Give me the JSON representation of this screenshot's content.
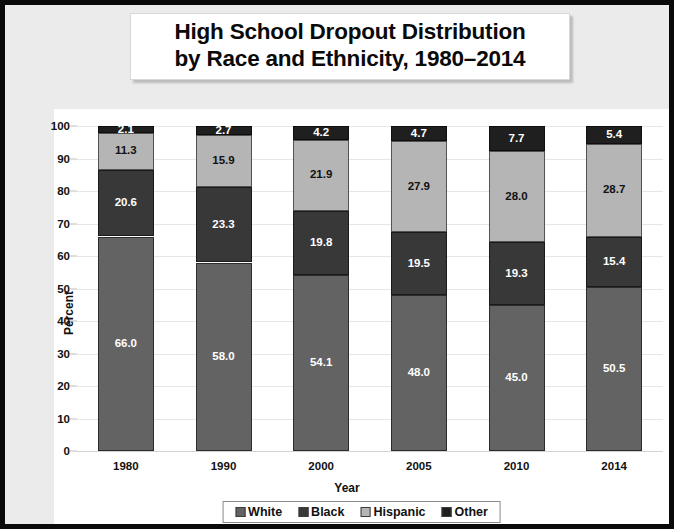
{
  "title": {
    "line1": "High School Dropout Distribution",
    "line2": "by Race and Ethnicity, 1980–2014"
  },
  "colors": {
    "white_series": "#636363",
    "black_series": "#383838",
    "hispanic_series": "#b5b5b5",
    "other_series": "#1f1f1f",
    "frame_border": "#0a0a0a",
    "page_background": "#ebebeb",
    "plot_background": "#ffffff",
    "gridline": "#e6e6e6"
  },
  "legend": {
    "position": "bottom",
    "items": [
      {
        "label": "White",
        "color": "#636363"
      },
      {
        "label": "Black",
        "color": "#383838"
      },
      {
        "label": "Hispanic",
        "color": "#b5b5b5"
      },
      {
        "label": "Other",
        "color": "#1f1f1f"
      }
    ]
  },
  "chart_data": {
    "type": "bar",
    "stacked": true,
    "stack_order_bottom_to_top": [
      "White",
      "Black",
      "Hispanic",
      "Other"
    ],
    "title": "High School Dropout Distribution by Race and Ethnicity, 1980–2014",
    "xlabel": "Year",
    "ylabel": "Percent",
    "ylim": [
      0,
      100
    ],
    "yticks": [
      0,
      10,
      20,
      30,
      40,
      50,
      60,
      70,
      80,
      90,
      100
    ],
    "ytick_labels": [
      "0",
      "10",
      "20",
      "30",
      "40",
      "50",
      "60",
      "70",
      "80",
      "90",
      "100"
    ],
    "grid": true,
    "legend_position": "bottom",
    "categories": [
      "1980",
      "1990",
      "2000",
      "2005",
      "2010",
      "2014"
    ],
    "series": [
      {
        "name": "White",
        "color": "#636363",
        "values": [
          66.0,
          58.0,
          54.1,
          48.0,
          45.0,
          50.5
        ],
        "labels": [
          "66.0",
          "58.0",
          "54.1",
          "48.0",
          "45.0",
          "50.5"
        ]
      },
      {
        "name": "Black",
        "color": "#383838",
        "values": [
          20.6,
          23.3,
          19.8,
          19.5,
          19.3,
          15.4
        ],
        "labels": [
          "20.6",
          "23.3",
          "19.8",
          "19.5",
          "19.3",
          "15.4"
        ]
      },
      {
        "name": "Hispanic",
        "color": "#b5b5b5",
        "values": [
          11.3,
          15.9,
          21.9,
          27.9,
          28.0,
          28.7
        ],
        "labels": [
          "11.3",
          "15.9",
          "21.9",
          "27.9",
          "28.0",
          "28.7"
        ]
      },
      {
        "name": "Other",
        "color": "#1f1f1f",
        "values": [
          2.1,
          2.7,
          4.2,
          4.7,
          7.7,
          5.4
        ],
        "labels": [
          "2.1",
          "2.7",
          "4.2",
          "4.7",
          "7.7",
          "5.4"
        ]
      }
    ]
  }
}
